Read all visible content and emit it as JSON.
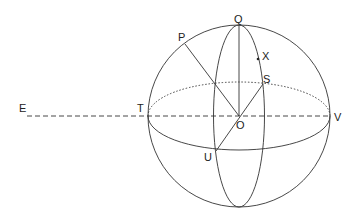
{
  "diagram": {
    "type": "sphere-geometry",
    "labels": {
      "Q": "Q",
      "P": "P",
      "X": "X",
      "S": "S",
      "E": "E",
      "T": "T",
      "O": "O",
      "V": "V",
      "U": "U"
    },
    "colors": {
      "stroke": "#333333",
      "background": "#ffffff"
    }
  }
}
